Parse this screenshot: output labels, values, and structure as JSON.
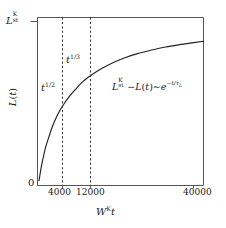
{
  "chart_data": {
    "type": "line",
    "title": "",
    "xlabel": "W^K t",
    "ylabel": "L(t)",
    "xlabel_parts": {
      "base": "W",
      "sup": "K",
      "var": "t"
    },
    "ylabel_parts": {
      "base": "L",
      "arg": "(t)"
    },
    "xlim": [
      0,
      44000
    ],
    "ylim": [
      0,
      1.06
    ],
    "grid": false,
    "legend": null,
    "x_ticks": [
      {
        "value": 4000,
        "label": "4000"
      },
      {
        "value": 12000,
        "label": "12000"
      },
      {
        "value": 40000,
        "label": "40000"
      }
    ],
    "y_ticks": [
      {
        "value": 0,
        "label": "0"
      },
      {
        "value": 1.0,
        "label": "L_st^K",
        "label_parts": {
          "base": "L",
          "sub": "st",
          "sup": "K"
        }
      }
    ],
    "series": [
      {
        "name": "L(t)",
        "style": "solid",
        "color": "#222222",
        "x": [
          400,
          700,
          1100,
          1600,
          2200,
          3000,
          4000,
          5200,
          6600,
          8200,
          10000,
          12000,
          14500,
          17000,
          20000,
          23000,
          26500,
          30000,
          34000,
          38000,
          40000,
          44000
        ],
        "y": [
          0.03,
          0.075,
          0.13,
          0.185,
          0.245,
          0.305,
          0.375,
          0.44,
          0.5,
          0.555,
          0.605,
          0.655,
          0.7,
          0.738,
          0.775,
          0.805,
          0.832,
          0.853,
          0.874,
          0.89,
          0.897,
          0.91
        ]
      }
    ],
    "vertical_markers": [
      {
        "value": 4000,
        "style": "dashed",
        "color": "#333333"
      },
      {
        "value": 12000,
        "style": "dashed",
        "color": "#333333"
      }
    ],
    "annotations": [
      {
        "id": "regime-sqrt",
        "text": "t^{1/2}",
        "parts": {
          "base": "t",
          "sup": "1/2"
        },
        "x": 2600,
        "y": 0.45
      },
      {
        "id": "regime-cbrt",
        "text": "t^{1/3}",
        "parts": {
          "base": "t",
          "sup": "1/3"
        },
        "x": 7600,
        "y": 0.62
      },
      {
        "id": "saturation-law",
        "text": "L_st^K - L(t) ~ e^{-t/tau_L}",
        "parts": {
          "lead_base": "L",
          "lead_sub": "st",
          "lead_sup": "K",
          "minus": "−",
          "term": "L(t)",
          "tilde": "∼",
          "exp_base": "e",
          "exp_sup_minus": "−",
          "exp_sup_num": "t",
          "exp_sup_slash": "/",
          "exp_sup_tau": "τ",
          "exp_sup_tau_sub": "L"
        },
        "x": 26000,
        "y": 0.47
      }
    ]
  },
  "figure": {
    "background": "#ffffff",
    "frame_color": "#555555",
    "curve_color": "#222222",
    "dash_color": "#333333",
    "text_color": "#1a1a1a"
  }
}
